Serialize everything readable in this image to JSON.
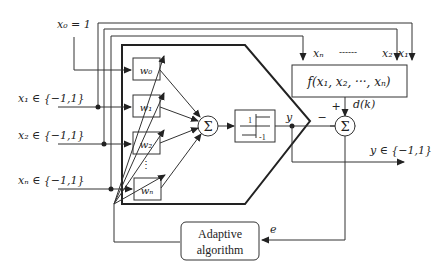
{
  "inputs": {
    "x0": "x₀ = 1",
    "x1": "x₁ ∈ {−1,1}",
    "x2": "x₂ ∈ {−1,1}",
    "xn": "xₙ ∈ {−1,1}"
  },
  "weights": [
    "w₀",
    "w₁",
    "w₂",
    "wₙ"
  ],
  "weights_ellipsis": "⋮",
  "summer_symbol": "Σ",
  "sign_block": {
    "high": "1",
    "low": "-1"
  },
  "output_label": "y",
  "output_range": "y ∈ {−1,1}",
  "target_function": {
    "label": "f(x₁, x₂, ···, xₙ)",
    "inputs_left": "xₙ",
    "inputs_dashes": "------",
    "inputs_right_2": "x₂",
    "inputs_right_1": "x₁"
  },
  "desired": "d(k)",
  "plus_sign": "+",
  "minus_sign": "−",
  "error_label": "e",
  "adaptive_box": {
    "line1": "Adaptive",
    "line2": "algorithm"
  }
}
